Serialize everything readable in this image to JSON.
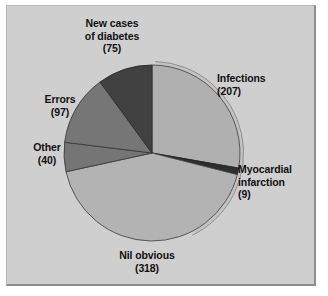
{
  "figure": {
    "background_color": "#ffffff",
    "panel_color": "#cfcfcf",
    "panel_border_color": "#8e8e8e"
  },
  "chart_data": {
    "type": "pie",
    "title": "",
    "subtitle": "",
    "xlabel": "",
    "ylabel": "",
    "grid": false,
    "legend_position": "none",
    "labels_placement": "outside-callout",
    "total": 746,
    "start_angle_deg": -90,
    "direction": "clockwise",
    "center": {
      "x": 152,
      "y": 153
    },
    "radius": 88,
    "categories": [
      "Infections",
      "Myocardial infarction",
      "Nil obvious",
      "Other",
      "Errors",
      "New cases of diabetes"
    ],
    "values": [
      207,
      9,
      318,
      40,
      97,
      75
    ],
    "colors": [
      "#b0b0b0",
      "#2e2e2e",
      "#b3b3b3",
      "#757575",
      "#767676",
      "#414141"
    ],
    "slices": [
      {
        "name": "Infections",
        "value": 207,
        "value_text": "(207)",
        "label_lines": [
          "Infections",
          "(207)"
        ],
        "color": "#b0b0b0",
        "percent": 27.7,
        "angle_deg": 99.9
      },
      {
        "name": "Myocardial infarction",
        "value": 9,
        "value_text": "(9)",
        "label_lines": [
          "Myocardial",
          "infarction",
          "(9)"
        ],
        "color": "#2e2e2e",
        "percent": 1.2,
        "angle_deg": 4.3
      },
      {
        "name": "Nil obvious",
        "value": 318,
        "value_text": "(318)",
        "label_lines": [
          "Nil obvious",
          "(318)"
        ],
        "color": "#b3b3b3",
        "percent": 42.6,
        "angle_deg": 153.5
      },
      {
        "name": "Other",
        "value": 40,
        "value_text": "(40)",
        "label_lines": [
          "Other",
          "(40)"
        ],
        "color": "#757575",
        "percent": 5.4,
        "angle_deg": 19.3
      },
      {
        "name": "Errors",
        "value": 97,
        "value_text": "(97)",
        "label_lines": [
          "Errors",
          "(97)"
        ],
        "color": "#767676",
        "percent": 13.0,
        "angle_deg": 46.8
      },
      {
        "name": "New cases of diabetes",
        "value": 75,
        "value_text": "(75)",
        "label_lines": [
          "New cases",
          "of diabetes",
          "(75)"
        ],
        "color": "#414141",
        "percent": 10.1,
        "angle_deg": 36.2
      }
    ]
  },
  "labels": {
    "diabetes": {
      "l1": "New cases",
      "l2": "of diabetes",
      "l3": "(75)"
    },
    "infections": {
      "l1": "Infections",
      "l2": "(207)"
    },
    "myocardial": {
      "l1": "Myocardial",
      "l2": "infarction",
      "l3": "(9)"
    },
    "errors": {
      "l1": "Errors",
      "l2": "(97)"
    },
    "other": {
      "l1": "Other",
      "l2": "(40)"
    },
    "nil": {
      "l1": "Nil obvious",
      "l2": "(318)"
    }
  }
}
